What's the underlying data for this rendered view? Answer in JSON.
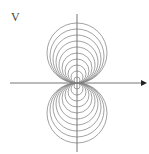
{
  "diagram": {
    "axis_label": "V",
    "center": {
      "x": 77,
      "y": 83
    },
    "radii": [
      30,
      27,
      24,
      21,
      18,
      15,
      12,
      9,
      6,
      3
    ],
    "stroke_color": "#8a8a8a",
    "axis_color": "#777777",
    "arrow_color": "#222222"
  }
}
